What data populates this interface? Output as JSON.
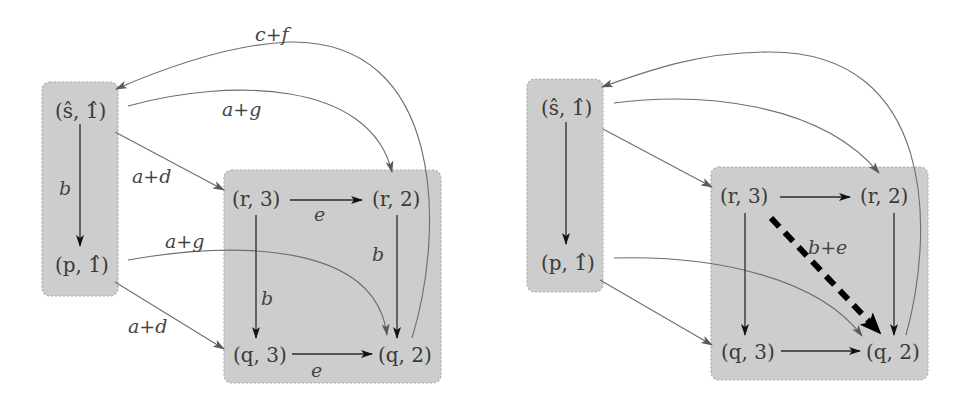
{
  "diagrams": [
    {
      "id": "left",
      "nodes": {
        "s1": "(ŝ, 1̂)",
        "p1": "(p, 1̂)",
        "r3": "(r, 3)",
        "r2": "(r, 2)",
        "q3": "(q, 3)",
        "q2": "(q, 2)"
      },
      "edge_labels": {
        "s1_p1": "b",
        "s1_r3": "a+d",
        "s1_r2": "a+g",
        "p1_q3": "a+d",
        "p1_q2": "a+g",
        "r3_r2": "e",
        "r3_q3": "b",
        "r2_q2": "b",
        "q3_q2": "e",
        "q2_s1": "c+f"
      }
    },
    {
      "id": "right",
      "nodes": {
        "s1": "(ŝ, 1̂)",
        "p1": "(p, 1̂)",
        "r3": "(r, 3)",
        "r2": "(r, 2)",
        "q3": "(q, 3)",
        "q2": "(q, 2)"
      },
      "edge_labels": {
        "r3_q2": "b+e"
      }
    }
  ],
  "colors": {
    "box_fill": "#cdcdcd",
    "edge_black": "#2a2a2a",
    "edge_gray": "#6e6e6e",
    "shortcut_edge": "#000000"
  }
}
